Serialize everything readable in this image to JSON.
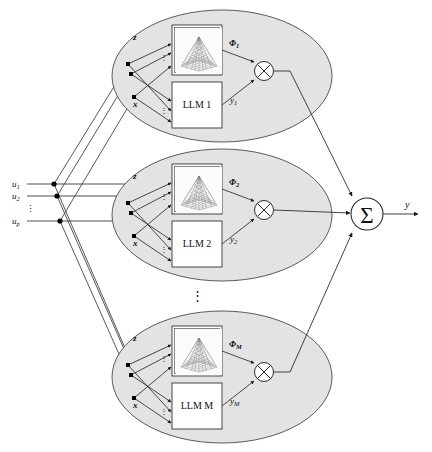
{
  "figure": {
    "type": "block-diagram",
    "background": "#ffffff",
    "colors": {
      "ellipse_fill": "#e3e3e3",
      "ellipse_stroke": "#4a4a4a",
      "box_fill": "#ffffff",
      "box_stroke": "#333333",
      "line": "#3a3a3a",
      "node_dot": "#000000",
      "text": "#111111"
    }
  },
  "inputs": {
    "label_group": "u",
    "items": [
      {
        "label": "u",
        "subscript": "1"
      },
      {
        "label": "u",
        "subscript": "2"
      },
      {
        "label": "u",
        "subscript": "p"
      }
    ],
    "vertical_ellipsis": "⋮"
  },
  "experts": [
    {
      "index": 1,
      "llm_label": "LLM 1",
      "gaussian_plot_name": "gaussian-surface-plot",
      "input_label_top": "z",
      "input_label_bottom": "x",
      "phi_label": "Φ",
      "phi_subscript": "1",
      "y_label": "y",
      "y_subscript": "1",
      "product_symbol": "⊗",
      "vertical_ellipsis": "⋮"
    },
    {
      "index": 2,
      "llm_label": "LLM 2",
      "gaussian_plot_name": "gaussian-surface-plot",
      "input_label_top": "z",
      "input_label_bottom": "x",
      "phi_label": "Φ",
      "phi_subscript": "2",
      "y_label": "y",
      "y_subscript": "2",
      "product_symbol": "⊗",
      "vertical_ellipsis": "⋮"
    },
    {
      "index": 3,
      "llm_label": "LLM M",
      "gaussian_plot_name": "gaussian-surface-plot",
      "input_label_top": "z",
      "input_label_bottom": "x",
      "phi_label": "Φ",
      "phi_subscript": "M",
      "y_label": "y",
      "y_subscript": "M",
      "product_symbol": "⊗",
      "vertical_ellipsis": "⋮"
    }
  ],
  "expert_stack_ellipsis": "⋮",
  "summation": {
    "symbol": "Σ",
    "name": "summation-node"
  },
  "output": {
    "label": "y"
  }
}
